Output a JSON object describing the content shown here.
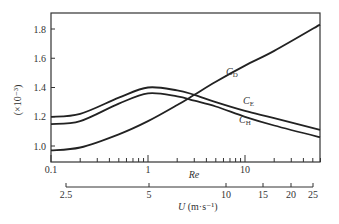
{
  "chart_data": {
    "type": "line",
    "title": "",
    "xlabel": "Re",
    "xscale": "log",
    "xlim": [
      0.1,
      60
    ],
    "x_ticks": [
      0.1,
      1,
      10
    ],
    "x_tick_labels": [
      "0.1",
      "1",
      "10"
    ],
    "secondary_xlabel": "U (m·s⁻¹)",
    "secondary_x_ticks": [
      2.5,
      5,
      10,
      15,
      20,
      25
    ],
    "secondary_x_tick_labels": [
      "2.5",
      "5",
      "10",
      "15",
      "20",
      "25"
    ],
    "ylabel": "(×10⁻³)",
    "ylim": [
      0.92,
      1.9
    ],
    "y_ticks": [
      1.0,
      1.2,
      1.4,
      1.6,
      1.8
    ],
    "y_tick_labels": [
      "1.0",
      "1.2",
      "1.4",
      "1.6",
      "1.8"
    ],
    "grid": false,
    "legend": "inline labels",
    "x": [
      0.1,
      0.2,
      0.5,
      1,
      2,
      3,
      5,
      10,
      20,
      60
    ],
    "series": [
      {
        "name": "C_D",
        "label_main": "C",
        "label_sub": "D",
        "values": [
          0.97,
          0.99,
          1.08,
          1.17,
          1.28,
          1.35,
          1.44,
          1.55,
          1.65,
          1.83
        ]
      },
      {
        "name": "C_E",
        "label_main": "C",
        "label_sub": "E",
        "values": [
          1.2,
          1.22,
          1.33,
          1.4,
          1.38,
          1.35,
          1.3,
          1.24,
          1.19,
          1.11
        ]
      },
      {
        "name": "C_H",
        "label_main": "C",
        "label_sub": "H",
        "values": [
          1.15,
          1.17,
          1.29,
          1.36,
          1.34,
          1.31,
          1.27,
          1.2,
          1.14,
          1.06
        ]
      }
    ]
  },
  "axes": {
    "y_label": "(×10⁻³)",
    "x_label": "Re",
    "u_label_main": "U",
    "u_label_unit": " (m·s⁻¹)"
  }
}
